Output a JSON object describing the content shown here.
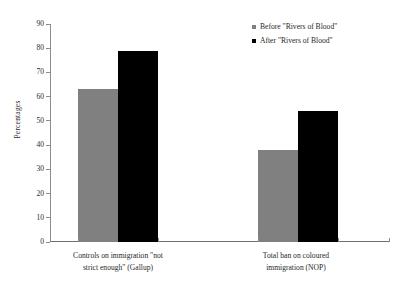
{
  "chart_data": {
    "type": "bar",
    "title": "",
    "subtitle": "",
    "xlabel": "",
    "ylabel": "Percentages",
    "ylim": [
      0,
      90
    ],
    "yticks": [
      0,
      10,
      20,
      30,
      40,
      50,
      60,
      70,
      80,
      90
    ],
    "grid": false,
    "legend_position": "top-right",
    "categories": [
      "Controls on immigration \"not strict enough\" (Gallup)",
      "Total ban on coloured immigration (NOP)"
    ],
    "category_lines": [
      [
        "Controls on immigration \"not",
        "strict enough\" (Gallup)"
      ],
      [
        "Total ban on coloured",
        "immigration (NOP)"
      ]
    ],
    "series": [
      {
        "name": "Before \"Rivers of Blood\"",
        "color": "#808080",
        "values": [
          63,
          38
        ]
      },
      {
        "name": "After \"Rivers of Blood\"",
        "color": "#000000",
        "values": [
          79,
          54
        ]
      }
    ]
  },
  "legend": {
    "items": [
      {
        "label": "Before \"Rivers of Blood\"",
        "swatch": "legend-swatch-before"
      },
      {
        "label": "After \"Rivers of Blood\"",
        "swatch": "legend-swatch-after"
      }
    ]
  },
  "axis": {
    "y_title": "Percentages",
    "y_tick_labels": [
      "90",
      "80",
      "70",
      "60",
      "50",
      "40",
      "30",
      "20",
      "10",
      "0"
    ]
  }
}
